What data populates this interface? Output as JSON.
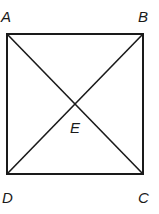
{
  "diagram": {
    "type": "square-with-diagonals",
    "stroke_color": "#1a1a1a",
    "points": [
      {
        "name": "A",
        "label": "A",
        "x": 7,
        "y": 34
      },
      {
        "name": "B",
        "label": "B",
        "x": 143,
        "y": 34
      },
      {
        "name": "C",
        "label": "C",
        "x": 143,
        "y": 174
      },
      {
        "name": "D",
        "label": "D",
        "x": 7,
        "y": 174
      },
      {
        "name": "E",
        "label": "E",
        "x": 76,
        "y": 105
      }
    ],
    "segments": [
      "AB",
      "BC",
      "CD",
      "DA",
      "AC",
      "BD"
    ]
  }
}
